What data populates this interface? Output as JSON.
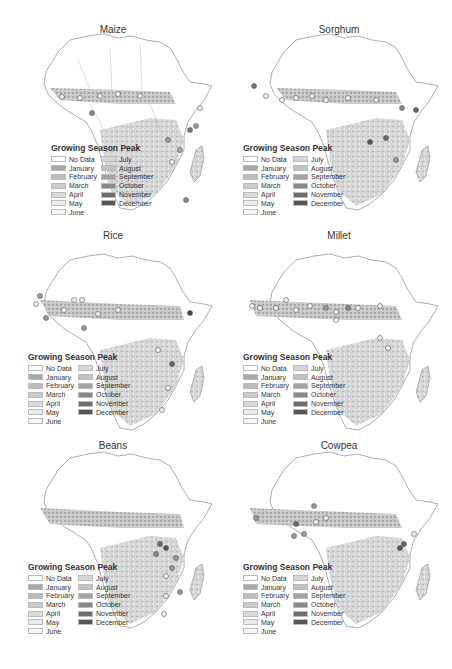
{
  "figure": {
    "legend": {
      "title": "Growing Season Peak",
      "items": [
        {
          "label": "No Data",
          "color": "#ffffff"
        },
        {
          "label": "January",
          "color": "#a8a8a8"
        },
        {
          "label": "February",
          "color": "#bcbcbc"
        },
        {
          "label": "March",
          "color": "#cbcbcb"
        },
        {
          "label": "April",
          "color": "#dadada"
        },
        {
          "label": "May",
          "color": "#ececec"
        },
        {
          "label": "June",
          "color": "#f6f6f6"
        },
        {
          "label": "July",
          "color": "#d6d6d6"
        },
        {
          "label": "August",
          "color": "#c2c2c2"
        },
        {
          "label": "September",
          "color": "#a4a4a4"
        },
        {
          "label": "October",
          "color": "#8a8a8a"
        },
        {
          "label": "November",
          "color": "#6e6e6e"
        },
        {
          "label": "December",
          "color": "#555555"
        }
      ]
    },
    "panels": [
      {
        "title": "Maize"
      },
      {
        "title": "Sorghum"
      },
      {
        "title": "Rice"
      },
      {
        "title": "Millet"
      },
      {
        "title": "Beans"
      },
      {
        "title": "Cowpea"
      }
    ]
  }
}
